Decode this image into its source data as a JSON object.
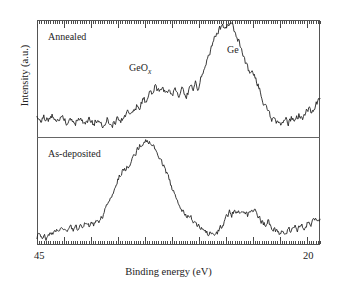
{
  "figure": {
    "type": "xps-spectrum-figure",
    "panels": [
      {
        "id": "annealed",
        "label": "Annealed"
      },
      {
        "id": "as-deposited",
        "label": "As-deposited"
      }
    ],
    "annotations": [
      {
        "id": "geox",
        "text": "GeO",
        "subscript": "x"
      },
      {
        "id": "ge",
        "text": "Ge"
      }
    ]
  },
  "axes": {
    "xlabel": "Binding energy (eV)",
    "ylabel": "Intensity (a.u.)",
    "xtick_left": "45",
    "xtick_right": "20"
  },
  "colors": {
    "trace": "#222222",
    "frame": "#555555",
    "divider": "#666666",
    "background": "#ffffff"
  },
  "chart_data": {
    "type": "line",
    "title": "",
    "xlabel": "Binding energy (eV)",
    "ylabel": "Intensity (a.u.)",
    "xlim": [
      45,
      20
    ],
    "x_reversed": true,
    "ylim": [
      0,
      1
    ],
    "grid": false,
    "legend_position": "in-plot-labels",
    "tick_labels_x": [
      "45",
      "20"
    ],
    "annotations": [
      {
        "text": "Annealed",
        "x": 43.5,
        "panel": "annealed"
      },
      {
        "text": "As-deposited",
        "x": 43.5,
        "panel": "as-deposited"
      },
      {
        "text": "GeOx",
        "x": 36.6,
        "panel": "annealed"
      },
      {
        "text": "Ge",
        "x": 28.2,
        "panel": "annealed"
      }
    ],
    "series": [
      {
        "name": "Annealed",
        "panel": "annealed",
        "peaks": [
          {
            "label": "GeOx",
            "center_eV": 36.2,
            "relative_height": 0.46
          },
          {
            "label": "Ge",
            "center_eV": 29.0,
            "relative_height": 1.0
          }
        ],
        "x": [
          45.0,
          44.8,
          44.6,
          44.4,
          44.2,
          44.0,
          43.8,
          43.6,
          43.4,
          43.2,
          43.0,
          42.8,
          42.6,
          42.4,
          42.2,
          42.0,
          41.8,
          41.6,
          41.4,
          41.2,
          41.0,
          40.8,
          40.6,
          40.4,
          40.2,
          40.0,
          39.8,
          39.6,
          39.4,
          39.2,
          39.0,
          38.8,
          38.6,
          38.4,
          38.2,
          38.0,
          37.8,
          37.6,
          37.4,
          37.2,
          37.0,
          36.8,
          36.6,
          36.4,
          36.2,
          36.0,
          35.8,
          35.6,
          35.4,
          35.2,
          35.0,
          34.8,
          34.6,
          34.4,
          34.2,
          34.0,
          33.8,
          33.6,
          33.4,
          33.2,
          33.0,
          32.8,
          32.6,
          32.4,
          32.2,
          32.0,
          31.8,
          31.6,
          31.4,
          31.2,
          31.0,
          30.8,
          30.6,
          30.4,
          30.2,
          30.0,
          29.8,
          29.6,
          29.4,
          29.2,
          29.0,
          28.8,
          28.6,
          28.4,
          28.2,
          28.0,
          27.8,
          27.6,
          27.4,
          27.2,
          27.0,
          26.8,
          26.6,
          26.4,
          26.2,
          26.0,
          25.8,
          25.6,
          25.4,
          25.2,
          25.0,
          24.8,
          24.6,
          24.4,
          24.2,
          24.0,
          23.8,
          23.6,
          23.4,
          23.2,
          23.0,
          22.8,
          22.6,
          22.4,
          22.2,
          22.0,
          21.8,
          21.6,
          21.4,
          21.2,
          21.0,
          20.8,
          20.6,
          20.4,
          20.2,
          20.0
        ],
        "y": [
          0.175,
          0.155,
          0.135,
          0.165,
          0.145,
          0.12,
          0.15,
          0.17,
          0.14,
          0.115,
          0.145,
          0.165,
          0.135,
          0.11,
          0.14,
          0.16,
          0.13,
          0.105,
          0.135,
          0.16,
          0.125,
          0.1,
          0.13,
          0.155,
          0.12,
          0.095,
          0.125,
          0.15,
          0.115,
          0.09,
          0.12,
          0.145,
          0.11,
          0.085,
          0.105,
          0.135,
          0.155,
          0.12,
          0.145,
          0.175,
          0.2,
          0.165,
          0.19,
          0.225,
          0.26,
          0.23,
          0.28,
          0.33,
          0.3,
          0.36,
          0.42,
          0.38,
          0.44,
          0.41,
          0.38,
          0.43,
          0.4,
          0.36,
          0.42,
          0.39,
          0.35,
          0.41,
          0.38,
          0.345,
          0.4,
          0.365,
          0.33,
          0.39,
          0.43,
          0.4,
          0.455,
          0.42,
          0.48,
          0.54,
          0.6,
          0.66,
          0.72,
          0.78,
          0.84,
          0.89,
          0.93,
          0.96,
          0.975,
          0.955,
          0.985,
          0.96,
          0.99,
          0.945,
          0.9,
          0.84,
          0.78,
          0.72,
          0.66,
          0.6,
          0.555,
          0.58,
          0.54,
          0.48,
          0.42,
          0.36,
          0.3,
          0.25,
          0.205,
          0.17,
          0.14,
          0.12,
          0.105,
          0.125,
          0.1,
          0.12,
          0.145,
          0.115,
          0.14,
          0.165,
          0.13,
          0.155,
          0.18,
          0.15,
          0.175,
          0.205,
          0.235,
          0.2,
          0.23,
          0.26,
          0.29,
          0.32
        ]
      },
      {
        "name": "As-deposited",
        "panel": "as-deposited",
        "peaks": [
          {
            "label": "GeOx",
            "center_eV": 36.0,
            "relative_height": 1.0
          },
          {
            "label": "Ge",
            "center_eV": 27.5,
            "relative_height": 0.33
          }
        ],
        "x": [
          45.0,
          44.8,
          44.6,
          44.4,
          44.2,
          44.0,
          43.8,
          43.6,
          43.4,
          43.2,
          43.0,
          42.8,
          42.6,
          42.4,
          42.2,
          42.0,
          41.8,
          41.6,
          41.4,
          41.2,
          41.0,
          40.8,
          40.6,
          40.4,
          40.2,
          40.0,
          39.8,
          39.6,
          39.4,
          39.2,
          39.0,
          38.8,
          38.6,
          38.4,
          38.2,
          38.0,
          37.8,
          37.6,
          37.4,
          37.2,
          37.0,
          36.8,
          36.6,
          36.4,
          36.2,
          36.0,
          35.8,
          35.6,
          35.4,
          35.2,
          35.0,
          34.8,
          34.6,
          34.4,
          34.2,
          34.0,
          33.8,
          33.6,
          33.4,
          33.2,
          33.0,
          32.8,
          32.6,
          32.4,
          32.2,
          32.0,
          31.8,
          31.6,
          31.4,
          31.2,
          31.0,
          30.8,
          30.6,
          30.4,
          30.2,
          30.0,
          29.8,
          29.6,
          29.4,
          29.2,
          29.0,
          28.8,
          28.6,
          28.4,
          28.2,
          28.0,
          27.8,
          27.6,
          27.4,
          27.2,
          27.0,
          26.8,
          26.6,
          26.4,
          26.2,
          26.0,
          25.8,
          25.6,
          25.4,
          25.2,
          25.0,
          24.8,
          24.6,
          24.4,
          24.2,
          24.0,
          23.8,
          23.6,
          23.4,
          23.2,
          23.0,
          22.8,
          22.6,
          22.4,
          22.2,
          22.0,
          21.8,
          21.6,
          21.4,
          21.2,
          21.0,
          20.8,
          20.6,
          20.4,
          20.2,
          20.0
        ],
        "y": [
          0.045,
          0.075,
          0.03,
          0.06,
          0.02,
          0.05,
          0.085,
          0.055,
          0.09,
          0.115,
          0.085,
          0.12,
          0.095,
          0.125,
          0.1,
          0.13,
          0.105,
          0.135,
          0.115,
          0.145,
          0.12,
          0.155,
          0.185,
          0.15,
          0.19,
          0.165,
          0.2,
          0.175,
          0.215,
          0.25,
          0.3,
          0.35,
          0.4,
          0.45,
          0.5,
          0.56,
          0.61,
          0.66,
          0.7,
          0.69,
          0.73,
          0.76,
          0.8,
          0.84,
          0.88,
          0.92,
          0.95,
          0.975,
          0.99,
          0.965,
          0.975,
          0.94,
          0.9,
          0.87,
          0.83,
          0.78,
          0.73,
          0.68,
          0.62,
          0.56,
          0.5,
          0.44,
          0.39,
          0.34,
          0.3,
          0.265,
          0.235,
          0.26,
          0.23,
          0.2,
          0.175,
          0.15,
          0.13,
          0.11,
          0.09,
          0.075,
          0.065,
          0.08,
          0.06,
          0.075,
          0.095,
          0.13,
          0.165,
          0.2,
          0.24,
          0.28,
          0.255,
          0.3,
          0.27,
          0.31,
          0.28,
          0.32,
          0.29,
          0.25,
          0.29,
          0.33,
          0.3,
          0.27,
          0.24,
          0.2,
          0.17,
          0.15,
          0.19,
          0.16,
          0.13,
          0.105,
          0.085,
          0.065,
          0.09,
          0.07,
          0.095,
          0.12,
          0.095,
          0.12,
          0.145,
          0.11,
          0.135,
          0.16,
          0.13,
          0.155,
          0.185,
          0.16,
          0.19,
          0.215,
          0.19,
          0.23
        ]
      }
    ]
  }
}
